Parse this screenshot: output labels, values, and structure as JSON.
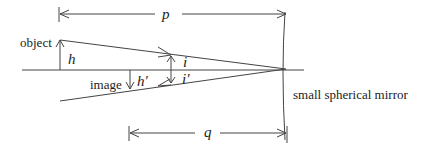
{
  "diagram": {
    "labels": {
      "object": "object",
      "image": "image",
      "mirror": "small spherical mirror",
      "p": "p",
      "q": "q",
      "h": "h",
      "h_prime": "h′",
      "i": "i",
      "i_prime": "i′"
    },
    "colors": {
      "line": "#444444",
      "text": "#222222",
      "background": "#ffffff"
    }
  }
}
